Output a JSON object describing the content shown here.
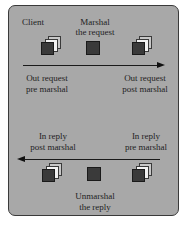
{
  "diagram": {
    "top": {
      "labels": {
        "client": "Client",
        "marshal_line1": "Marshal",
        "marshal_line2": "the request",
        "out_pre_line1": "Out request",
        "out_pre_line2": "pre marshal",
        "out_post_line1": "Out request",
        "out_post_line2": "post marshal"
      },
      "arrow_direction": "right"
    },
    "bottom": {
      "labels": {
        "in_post_line1": "In reply",
        "in_post_line2": "post marshal",
        "in_pre_line1": "In reply",
        "in_pre_line2": "pre marshal",
        "unmarshal_line1": "Unmarshal",
        "unmarshal_line2": "the reply"
      },
      "arrow_direction": "left"
    },
    "icons": {
      "stack": "document-stack-icon",
      "single": "single-block-icon"
    },
    "colors": {
      "panel": "#a8a8a8",
      "border": "#3a3a3a",
      "block": "#3a3a3a",
      "arrow": "#111111"
    }
  }
}
